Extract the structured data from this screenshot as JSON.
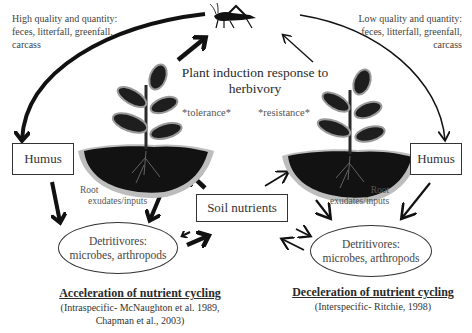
{
  "left_note": {
    "line1": "High quality and quantity:",
    "line2": "feces, litterfall, greenfall,",
    "line3": "carcass"
  },
  "right_note": {
    "line1": "Low quality and quantity:",
    "line2": "feces, litterfall, greenfall,",
    "line3": "carcass"
  },
  "center_title": {
    "line1": "Plant induction response to",
    "line2": "herbivory"
  },
  "left_plant": {
    "label": "*tolerance*"
  },
  "right_plant": {
    "label": "*resistance*"
  },
  "humus_left": {
    "label": "Humus"
  },
  "humus_right": {
    "label": "Humus"
  },
  "soil_nutrients": {
    "label": "Soil nutrients"
  },
  "root_left": {
    "line1": "Root",
    "line2": "exudates/inputs"
  },
  "root_right": {
    "line1": "Root",
    "line2": "exudates/inputs"
  },
  "detritivores_left": {
    "line1": "Detritivores:",
    "line2": "microbes, arthropods"
  },
  "detritivores_right": {
    "line1": "Detritivores:",
    "line2": "microbes, arthropods"
  },
  "left_caption": {
    "heading": "Acceleration of nutrient cycling",
    "cite1": "(Intraspecific- McNaughton et al. 1989,",
    "cite2": "Chapman et al., 2003)"
  },
  "right_caption": {
    "heading": "Deceleration of nutrient cycling",
    "cite1": "(Interspecific- Ritchie, 1998)"
  },
  "icons": {
    "herbivore": "grasshopper-icon",
    "plant": "plant-in-soil-icon"
  },
  "colors": {
    "stroke": "#1a1a1a",
    "soil_dark": "#111111",
    "soil_halo": "#b8b8b8",
    "text": "#3a3a3a"
  }
}
